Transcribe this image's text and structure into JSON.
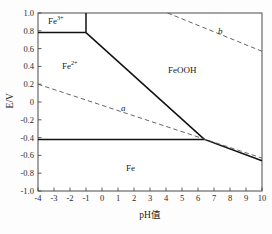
{
  "chart_data": {
    "type": "line",
    "title": "",
    "xlabel": "pH值",
    "ylabel": "E/V",
    "xlim": [
      -4,
      10
    ],
    "ylim": [
      -1.0,
      1.0
    ],
    "grid": false,
    "legend": "none",
    "xticks": [
      "-4",
      "-3",
      "-2",
      "-1",
      "0",
      "1",
      "2",
      "3",
      "4",
      "5",
      "6",
      "7",
      "8",
      "9",
      "10"
    ],
    "yticks": [
      "1.0",
      "0.8",
      "0.6",
      "0.4",
      "0.2",
      "0",
      "-0.2",
      "-0.4",
      "-0.6",
      "-0.8",
      "-1.0"
    ],
    "regions": [
      {
        "name": "Fe3+",
        "label_text": "Fe",
        "label_sup": "3+",
        "x": -2.5,
        "y": 0.9
      },
      {
        "name": "Fe2+",
        "label_text": "Fe",
        "label_sup": "2+",
        "x": -1.6,
        "y": 0.42
      },
      {
        "name": "FeOOH",
        "label_text": "FeOOH",
        "label_sup": "",
        "x": 5.4,
        "y": 0.38
      },
      {
        "name": "Fe",
        "label_text": "Fe",
        "label_sup": "",
        "x": 2.4,
        "y": -0.77
      }
    ],
    "series": [
      {
        "name": "fe3-fe2-boundary-vertical",
        "style": "solid",
        "points": [
          [
            -1.0,
            1.0
          ],
          [
            -1.0,
            0.78
          ]
        ]
      },
      {
        "name": "fe3-feooh-boundary-horizontal",
        "style": "solid",
        "points": [
          [
            -4.0,
            0.78
          ],
          [
            -1.0,
            0.78
          ]
        ]
      },
      {
        "name": "fe2-feooh-boundary",
        "style": "solid",
        "points": [
          [
            -1.0,
            0.78
          ],
          [
            6.4,
            -0.42
          ]
        ]
      },
      {
        "name": "fe2-fe-boundary-horizontal",
        "style": "solid",
        "points": [
          [
            -4.0,
            -0.42
          ],
          [
            6.4,
            -0.42
          ]
        ]
      },
      {
        "name": "feooh-fe-boundary",
        "style": "solid",
        "points": [
          [
            6.4,
            -0.42
          ],
          [
            10.0,
            -0.66
          ]
        ]
      },
      {
        "name": "water-line-a",
        "style": "dashed",
        "label": "a",
        "points": [
          [
            -4.0,
            0.2
          ],
          [
            10.0,
            -0.63
          ]
        ]
      },
      {
        "name": "water-line-b",
        "style": "dashed",
        "label": "b",
        "points": [
          [
            4.1,
            1.0
          ],
          [
            10.0,
            0.57
          ]
        ]
      }
    ],
    "annotations": [
      {
        "text": "a",
        "x": 2.0,
        "y": -0.03,
        "style": "italic"
      },
      {
        "text": "b",
        "x": 7.8,
        "y": 0.72,
        "style": "italic"
      }
    ]
  },
  "axes": {
    "y_title": "E/V",
    "x_title": "pH值",
    "x_ticks": [
      "-4",
      "-3",
      "-2",
      "-1",
      "0",
      "1",
      "2",
      "3",
      "4",
      "5",
      "6",
      "7",
      "8",
      "9",
      "10"
    ],
    "y_ticks": [
      "1.0",
      "0.8",
      "0.6",
      "0.4",
      "0.2",
      "0",
      "-0.2",
      "-0.4",
      "-0.6",
      "-0.8",
      "-1.0"
    ]
  },
  "labels": {
    "fe3_base": "Fe",
    "fe3_sup": "3+",
    "fe2_base": "Fe",
    "fe2_sup": "2+",
    "feooh": "FeOOH",
    "fe": "Fe",
    "curve_a": "a",
    "curve_b": "b"
  },
  "colors": {
    "axis": "#3a3a3a",
    "solid_line": "#111111",
    "dashed_line": "#555555",
    "text": "#1a1a1a",
    "background": "#fdfdfd"
  }
}
